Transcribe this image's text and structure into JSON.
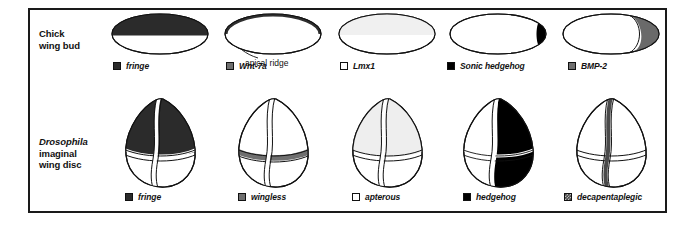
{
  "figure": {
    "rows": [
      {
        "id": "chick",
        "label_lines": [
          {
            "text": "Chick",
            "style": "plain"
          },
          {
            "text": "wing bud",
            "style": "plain"
          }
        ]
      },
      {
        "id": "drosophila",
        "label_lines": [
          {
            "text": "Drosophila",
            "style": "italic"
          },
          {
            "text": "imaginal",
            "style": "plain"
          },
          {
            "text": "wing disc",
            "style": "plain"
          }
        ]
      }
    ],
    "annotations": {
      "apical_ridge": "apical ridge"
    },
    "columns": [
      {
        "index": 1,
        "chick": {
          "gene": "fringe",
          "swatch": "dark",
          "swatch_color": "#2b2b2b",
          "domain": "dorsal-half-of-bud"
        },
        "fly": {
          "gene": "fringe",
          "swatch": "dark",
          "swatch_color": "#2b2b2b",
          "domain": "dorsal-compartment"
        }
      },
      {
        "index": 2,
        "chick": {
          "gene": "Wnt-7a",
          "swatch": "mid",
          "swatch_color": "#6f6f6f",
          "domain": "dorsal-rim-band"
        },
        "fly": {
          "gene": "wingless",
          "swatch": "mid",
          "swatch_color": "#6f6f6f",
          "domain": "dorsoventral-boundary-stripe"
        }
      },
      {
        "index": 3,
        "chick": {
          "gene": "Lmx1",
          "swatch": "white",
          "swatch_color": "#ffffff",
          "domain": "dorsal-half-pale"
        },
        "fly": {
          "gene": "apterous",
          "swatch": "white",
          "swatch_color": "#ffffff",
          "domain": "dorsal-compartment-pale"
        }
      },
      {
        "index": 4,
        "chick": {
          "gene": "Sonic hedgehog",
          "swatch": "black",
          "swatch_color": "#000000",
          "domain": "posterior-margin-crescent"
        },
        "fly": {
          "gene": "hedgehog",
          "swatch": "black",
          "swatch_color": "#000000",
          "domain": "posterior-compartment"
        }
      },
      {
        "index": 5,
        "chick": {
          "gene": "BMP-2",
          "swatch": "mid",
          "swatch_color": "#6f6f6f",
          "domain": "posterior-region"
        },
        "fly": {
          "gene": "decapentaplegic",
          "swatch": "hatch",
          "swatch_color": "#4a4a4a",
          "domain": "anteroposterior-boundary-stripe"
        }
      }
    ]
  }
}
